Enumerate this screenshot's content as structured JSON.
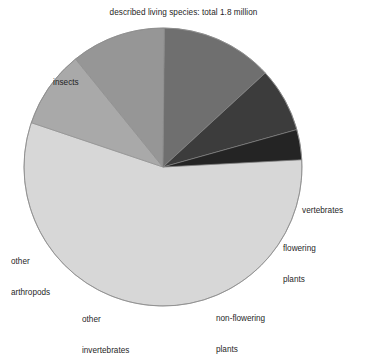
{
  "chart_data": {
    "type": "pie",
    "title": "described living species: total 1.8 million",
    "subtitle": "",
    "xlabel": "",
    "ylabel": "",
    "total_label": "total 1.8 million",
    "legend_position": "none",
    "labels_position": "outside",
    "grid": false,
    "categories": [
      "insects",
      "vertebrates",
      "flowering plants",
      "non-flowering plants",
      "other invertebrates",
      "other arthropods"
    ],
    "values": [
      56,
      3.5,
      7.5,
      13,
      11,
      9
    ],
    "units": "percent of total",
    "slices": [
      {
        "label": "insects",
        "value": 56,
        "start_deg": -3,
        "end_deg": 198.6,
        "color": "#d7d7d7"
      },
      {
        "label": "other arthropods",
        "value": 9,
        "start_deg": 198.6,
        "end_deg": 231.0,
        "color": "#a9a9a9"
      },
      {
        "label": "other invertebrates",
        "value": 11,
        "start_deg": 231.0,
        "end_deg": 270.6,
        "color": "#969696"
      },
      {
        "label": "non-flowering plants",
        "value": 13,
        "start_deg": 270.6,
        "end_deg": 317.4,
        "color": "#6f6f6f"
      },
      {
        "label": "flowering plants",
        "value": 7.5,
        "start_deg": 317.4,
        "end_deg": 344.4,
        "color": "#3c3c3c"
      },
      {
        "label": "vertebrates",
        "value": 3.5,
        "start_deg": 344.4,
        "end_deg": 357.0,
        "color": "#242424"
      }
    ]
  },
  "chart": {
    "title": "described living species: total 1.8 million",
    "labels": {
      "insects": "insects",
      "other_arthropods_line1": "other",
      "other_arthropods_line2": "arthropods",
      "other_invertebrates_line1": "other",
      "other_invertebrates_line2": "invertebrates",
      "non_flowering_line1": "non-flowering",
      "non_flowering_line2": "plants",
      "flowering_line1": "flowering",
      "flowering_line2": "plants",
      "vertebrates": "vertebrates"
    },
    "colors": {
      "insects": "#d7d7d7",
      "other_arthropods": "#a9a9a9",
      "other_invertebrates": "#969696",
      "non_flowering_plants": "#6f6f6f",
      "flowering_plants": "#3c3c3c",
      "vertebrates": "#242424",
      "outline": "#8a8a8a",
      "background": "#ffffff",
      "text": "#1f1f1f"
    },
    "geometry": {
      "center_x": 163,
      "center_y": 167,
      "radius": 139
    }
  }
}
